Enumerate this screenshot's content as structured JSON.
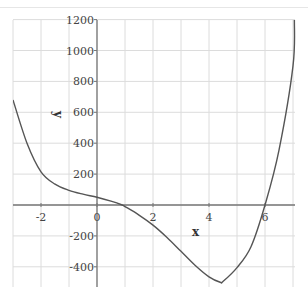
{
  "chart_data": {
    "type": "line",
    "title": "",
    "xlabel": "x",
    "ylabel": "y",
    "xlim": [
      -3,
      7.1
    ],
    "ylim": [
      -520,
      1200
    ],
    "grid": true,
    "legend": null,
    "x_ticks": [
      -2,
      0,
      2,
      4,
      6
    ],
    "y_ticks": [
      -400,
      -200,
      200,
      400,
      600,
      800,
      1000,
      1200
    ],
    "x_tick_labels": [
      "-2",
      "0",
      "2",
      "4",
      "6"
    ],
    "y_tick_labels": [
      "-400",
      "-200",
      "200",
      "400",
      "600",
      "800",
      "1000",
      "1200"
    ],
    "origin_label": "0",
    "series": [
      {
        "name": "y",
        "color": "#555555",
        "x": [
          -3,
          -2.5,
          -2,
          -1.5,
          -1,
          -0.5,
          0,
          0.5,
          0.9,
          1,
          1.5,
          2,
          2.5,
          3,
          3.5,
          4,
          4.4,
          4.5,
          5,
          5.5,
          6,
          6.5,
          7,
          7.05
        ],
        "y": [
          680,
          400,
          215,
          135,
          95,
          70,
          50,
          25,
          0,
          -10,
          -65,
          -130,
          -210,
          -300,
          -390,
          -465,
          -500,
          -495,
          -405,
          -270,
          0,
          355,
          900,
          1200
        ]
      }
    ]
  },
  "labels": {
    "x_axis": "x",
    "y_axis": "y"
  }
}
